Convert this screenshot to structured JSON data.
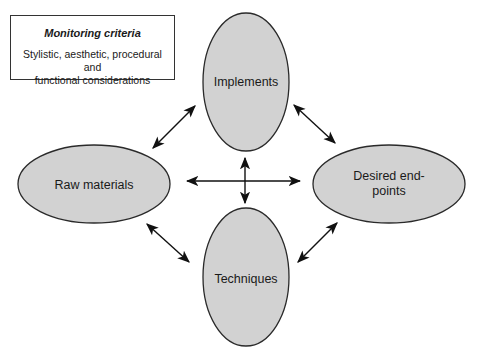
{
  "criteria": {
    "title": "Monitoring criteria",
    "body_line1": "Stylistic, aesthetic, procedural and",
    "body_line2": "functional considerations"
  },
  "nodes": {
    "top": {
      "label": "Implements"
    },
    "left": {
      "label": "Raw materials"
    },
    "right": {
      "label_line1": "Desired end-",
      "label_line2": "points"
    },
    "bottom": {
      "label": "Techniques"
    }
  },
  "colors": {
    "node_fill": "#d2d2d2",
    "node_stroke": "#2a2a2a",
    "arrow": "#111111"
  }
}
